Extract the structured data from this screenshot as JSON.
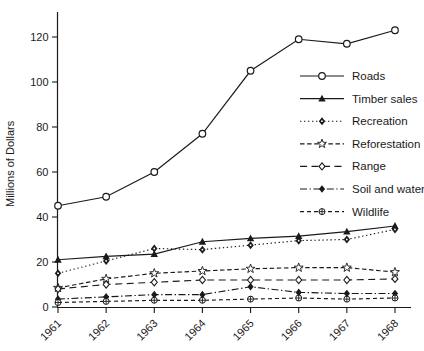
{
  "chart_data": {
    "type": "line",
    "title": "",
    "xlabel": "",
    "ylabel": "Millions of Dollars",
    "x": [
      1961,
      1962,
      1963,
      1964,
      1965,
      1966,
      1967,
      1968
    ],
    "ylim": [
      0,
      130
    ],
    "yticks": [
      0,
      20,
      40,
      60,
      80,
      100,
      120
    ],
    "grid": false,
    "legend_position": "right-center",
    "frame": "L-axes-only",
    "series": [
      {
        "name": "Roads",
        "marker": "open-circle",
        "line": "solid",
        "values": [
          45,
          49,
          60,
          77,
          105,
          119,
          117,
          123
        ]
      },
      {
        "name": "Timber sales",
        "marker": "filled-triangle",
        "line": "solid",
        "values": [
          21,
          22.5,
          23.5,
          29,
          30.5,
          31.5,
          33.5,
          36
        ]
      },
      {
        "name": "Recreation",
        "marker": "filled-diamond-dot",
        "line": "dotted",
        "values": [
          15,
          20.5,
          26,
          25.5,
          27.5,
          29.5,
          30,
          34.5
        ]
      },
      {
        "name": "Reforestation",
        "marker": "open-star",
        "line": "dashed",
        "values": [
          8.5,
          12.5,
          15,
          16,
          17,
          17.5,
          17.5,
          15.5
        ]
      },
      {
        "name": "Range",
        "marker": "open-diamond",
        "line": "dashed-long",
        "values": [
          8,
          10,
          11,
          12,
          12,
          12,
          12,
          12.5
        ]
      },
      {
        "name": "Soil and water",
        "marker": "filled-diamond",
        "line": "dashdot",
        "values": [
          3.5,
          4.5,
          5.5,
          5.5,
          9,
          6.5,
          6,
          6
        ]
      },
      {
        "name": "Wildlife",
        "marker": "circle-plus",
        "line": "dashed-short",
        "values": [
          2,
          2.5,
          3,
          3,
          3.5,
          4,
          3.5,
          4
        ]
      }
    ],
    "colors": {
      "line": "#1a1a1a",
      "background": "#ffffff"
    }
  }
}
